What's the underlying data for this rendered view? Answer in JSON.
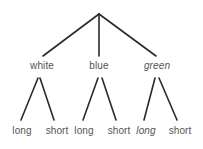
{
  "diagram": {
    "type": "tree",
    "background_color": "#ffffff",
    "line_color": "#2a2a2a",
    "text_color": "#555555",
    "root": {
      "label": "",
      "name": "root-node"
    },
    "level1": [
      {
        "label": "white",
        "italic": false,
        "x": 42
      },
      {
        "label": "blue",
        "italic": false,
        "x": 99
      },
      {
        "label": "green",
        "italic": true,
        "x": 157
      }
    ],
    "level2": [
      {
        "label": "long",
        "italic": false,
        "x": 22,
        "parent": 0
      },
      {
        "label": "short",
        "italic": false,
        "x": 57,
        "parent": 0
      },
      {
        "label": "long",
        "italic": false,
        "x": 84,
        "parent": 1
      },
      {
        "label": "short",
        "italic": false,
        "x": 119,
        "parent": 1
      },
      {
        "label": "long",
        "italic": true,
        "x": 146,
        "parent": 2
      },
      {
        "label": "short",
        "italic": false,
        "x": 180,
        "parent": 2
      }
    ],
    "edges_level1": [
      {
        "x1": 99,
        "y1": 14,
        "x2": 43,
        "y2": 56
      },
      {
        "x1": 99,
        "y1": 14,
        "x2": 99,
        "y2": 56
      },
      {
        "x1": 99,
        "y1": 14,
        "x2": 156,
        "y2": 56
      }
    ],
    "edges_level2": [
      {
        "x1": 38,
        "y1": 78,
        "x2": 21,
        "y2": 120
      },
      {
        "x1": 40,
        "y1": 78,
        "x2": 54,
        "y2": 120
      },
      {
        "x1": 98,
        "y1": 78,
        "x2": 83,
        "y2": 120
      },
      {
        "x1": 102,
        "y1": 78,
        "x2": 116,
        "y2": 120
      },
      {
        "x1": 155,
        "y1": 78,
        "x2": 144,
        "y2": 120
      },
      {
        "x1": 159,
        "y1": 78,
        "x2": 177,
        "y2": 120
      }
    ]
  }
}
